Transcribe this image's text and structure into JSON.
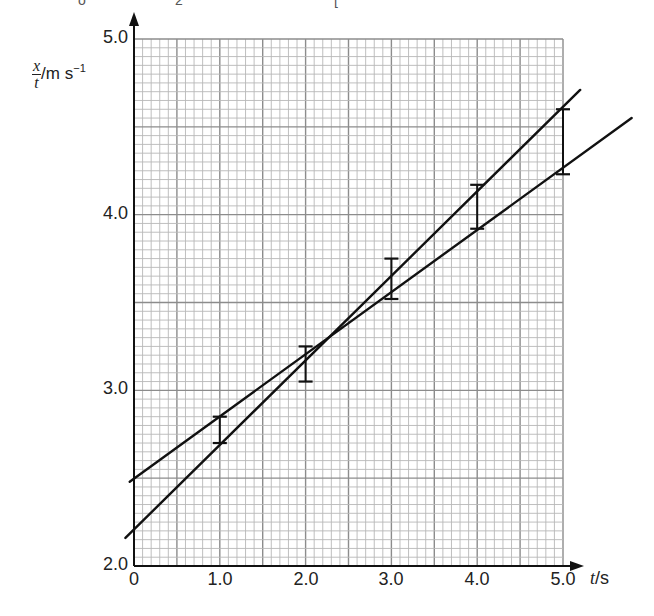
{
  "top_fragment": {
    "text_left": "o",
    "text_mid": "2",
    "text_right": "["
  },
  "chart_data": {
    "type": "scatter",
    "title": "",
    "xlabel": "t / s",
    "ylabel": "x/t / m s^-1",
    "xlabel_parts": {
      "var": "t",
      "unit": "/s"
    },
    "ylabel_parts": {
      "num": "x",
      "den": "t",
      "unit": "/m s",
      "exp": "−1"
    },
    "xlim": [
      0,
      5.0
    ],
    "ylim": [
      2.0,
      5.0
    ],
    "x_ticks": [
      "0",
      "1.0",
      "2.0",
      "3.0",
      "4.0",
      "5.0"
    ],
    "y_ticks": [
      "2.0",
      "3.0",
      "4.0",
      "5.0"
    ],
    "grid": {
      "on": true,
      "minor_step_x": 0.1,
      "minor_step_y": 0.05,
      "major_step_x": 0.5,
      "major_step_y": 0.5
    },
    "error_bars": [
      {
        "t": 1.0,
        "y_low": 2.7,
        "y_high": 2.85
      },
      {
        "t": 2.0,
        "y_low": 3.05,
        "y_high": 3.25
      },
      {
        "t": 3.0,
        "y_low": 3.52,
        "y_high": 3.75
      },
      {
        "t": 4.0,
        "y_low": 3.92,
        "y_high": 4.17
      },
      {
        "t": 5.0,
        "y_low": 4.23,
        "y_high": 4.6
      }
    ],
    "series": [
      {
        "name": "steepest line",
        "x": [
          -0.1,
          5.2
        ],
        "y": [
          2.16,
          4.71
        ]
      },
      {
        "name": "shallowest line",
        "x": [
          -0.05,
          5.8
        ],
        "y": [
          2.48,
          4.55
        ]
      }
    ],
    "legend": null
  },
  "colors": {
    "grid_minor": "#b8b8b8",
    "grid_major": "#8c8c8c",
    "axis": "#111111",
    "line": "#111111",
    "text": "#222222"
  }
}
